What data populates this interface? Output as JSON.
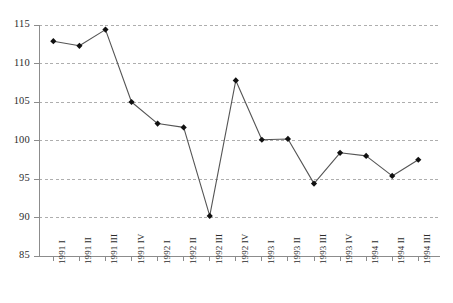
{
  "chart_data": {
    "type": "line",
    "title": "",
    "subtitle": "",
    "xlabel": "",
    "ylabel": "",
    "categories": [
      "1991 I",
      "1991 II",
      "1991 III",
      "1991 IV",
      "1992 I",
      "1992 II",
      "1992 III",
      "1992 IV",
      "1993 I",
      "1993 II",
      "1993 III",
      "1993 IV",
      "1994 I",
      "1994 II",
      "1994 III"
    ],
    "values": [
      112.9,
      112.3,
      114.4,
      105.0,
      102.2,
      101.7,
      90.2,
      107.8,
      100.1,
      100.2,
      94.4,
      98.4,
      98.0,
      95.4,
      97.5
    ],
    "series": [
      {
        "name": "Index",
        "values": [
          112.9,
          112.3,
          114.4,
          105.0,
          102.2,
          101.7,
          90.2,
          107.8,
          100.1,
          100.2,
          94.4,
          98.4,
          98.0,
          95.4,
          97.5
        ]
      }
    ],
    "ylim": [
      85,
      115
    ],
    "yticks": [
      85,
      90,
      95,
      100,
      105,
      110,
      115
    ],
    "ytick_labels": [
      "85",
      "90",
      "95",
      "100",
      "105",
      "110",
      "115"
    ],
    "grid": true,
    "grid_axis": "y",
    "grid_style": "dashed",
    "legend": false,
    "legend_position": "none",
    "marker": "diamond",
    "line_color": "#555555",
    "marker_color": "#111111",
    "grid_color": "#9a9a9a",
    "axis_color": "#8c8c8c",
    "background_color": "#ffffff",
    "xtick_rotation": -90
  }
}
